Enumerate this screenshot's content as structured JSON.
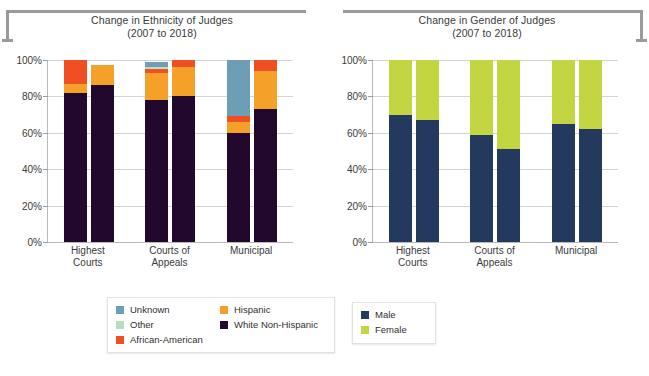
{
  "chart_data": [
    {
      "type": "bar",
      "subtype": "stacked-100-percent",
      "title": "Change in Ethnicity of Judges",
      "subtitle": "(2007 to 2018)",
      "xlabel": "",
      "ylabel": "",
      "ylim": [
        0,
        100
      ],
      "ytick_labels": [
        "100%",
        "80%",
        "60%",
        "40%",
        "20%",
        "0%"
      ],
      "yticks": [
        100,
        80,
        60,
        40,
        20,
        0
      ],
      "grid": true,
      "legend_position": "below",
      "categories": [
        "Highest Courts",
        "Courts of Appeals",
        "Municipal"
      ],
      "bars_per_category": [
        "2007",
        "2018"
      ],
      "series": [
        {
          "name": "White Non-Hispanic",
          "color": "#23082e",
          "values": [
            82,
            86,
            78,
            80,
            60,
            73
          ]
        },
        {
          "name": "Hispanic",
          "color": "#f5a028",
          "values": [
            5,
            11,
            15,
            16,
            6,
            21
          ]
        },
        {
          "name": "African-American",
          "color": "#f04e23",
          "values": [
            13,
            0,
            2,
            4,
            3,
            6
          ]
        },
        {
          "name": "Other",
          "color": "#b8ddc1",
          "values": [
            0,
            0,
            1,
            0,
            0,
            0
          ]
        },
        {
          "name": "Unknown",
          "color": "#6e9eb5",
          "values": [
            0,
            0,
            3,
            0,
            31,
            0
          ]
        }
      ]
    },
    {
      "type": "bar",
      "subtype": "stacked-100-percent",
      "title": "Change in Gender of Judges",
      "subtitle": "(2007 to 2018)",
      "xlabel": "",
      "ylabel": "",
      "ylim": [
        0,
        100
      ],
      "ytick_labels": [
        "100%",
        "80%",
        "60%",
        "40%",
        "20%",
        "0%"
      ],
      "yticks": [
        100,
        80,
        60,
        40,
        20,
        0
      ],
      "grid": true,
      "legend_position": "below",
      "categories": [
        "Highest Courts",
        "Courts of Appeals",
        "Municipal"
      ],
      "bars_per_category": [
        "2007",
        "2018"
      ],
      "series": [
        {
          "name": "Male",
          "color": "#23395d",
          "values": [
            70,
            67,
            59,
            51,
            65,
            62
          ]
        },
        {
          "name": "Female",
          "color": "#c3d641",
          "values": [
            30,
            33,
            41,
            49,
            35,
            38
          ]
        }
      ]
    }
  ],
  "ethnicity_chart": {
    "title": "Change in Ethnicity of Judges",
    "subtitle": "(2007 to 2018)",
    "y_ticks": [
      "100%",
      "80%",
      "60%",
      "40%",
      "20%",
      "0%"
    ],
    "categories": [
      {
        "line1": "Highest",
        "line2": "Courts"
      },
      {
        "line1": "Courts of",
        "line2": "Appeals"
      },
      {
        "line1": "Municipal",
        "line2": ""
      }
    ],
    "legend": [
      {
        "label": "Unknown",
        "color": "#6e9eb5"
      },
      {
        "label": "Other",
        "color": "#b8ddc1"
      },
      {
        "label": "African-American",
        "color": "#f04e23"
      },
      {
        "label": "Hispanic",
        "color": "#f5a028"
      },
      {
        "label": "White Non-Hispanic",
        "color": "#23082e"
      }
    ]
  },
  "gender_chart": {
    "title": "Change in Gender of Judges",
    "subtitle": "(2007 to 2018)",
    "y_ticks": [
      "100%",
      "80%",
      "60%",
      "40%",
      "20%",
      "0%"
    ],
    "categories": [
      {
        "line1": "Highest",
        "line2": "Courts"
      },
      {
        "line1": "Courts of",
        "line2": "Appeals"
      },
      {
        "line1": "Municipal",
        "line2": ""
      }
    ],
    "legend": [
      {
        "label": "Male",
        "color": "#23395d"
      },
      {
        "label": "Female",
        "color": "#c3d641"
      }
    ]
  }
}
